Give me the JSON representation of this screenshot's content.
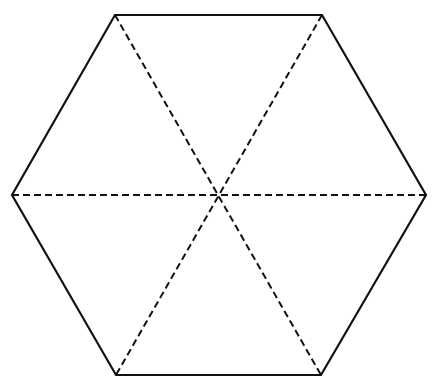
{
  "diagram": {
    "shape": "regular-hexagon",
    "background": "#ffffff",
    "stroke_color": "#111111",
    "outline_stroke_width": 2.2,
    "diagonal_stroke_width": 2,
    "diagonal_dash": "7 4",
    "center": {
      "x": 218,
      "y": 195
    },
    "vertices": [
      {
        "name": "top-left",
        "x": 115,
        "y": 15
      },
      {
        "name": "top-right",
        "x": 322,
        "y": 15
      },
      {
        "name": "right",
        "x": 426,
        "y": 195
      },
      {
        "name": "bottom-right",
        "x": 321,
        "y": 375
      },
      {
        "name": "bottom-left",
        "x": 116,
        "y": 375
      },
      {
        "name": "left",
        "x": 12,
        "y": 195
      }
    ],
    "diagonals": [
      {
        "name": "diagonal-top-left-to-bottom-right",
        "from": 0,
        "to": 3,
        "style": "dashed"
      },
      {
        "name": "diagonal-top-right-to-bottom-left",
        "from": 1,
        "to": 4,
        "style": "dashed"
      },
      {
        "name": "diagonal-left-to-right",
        "from": 5,
        "to": 2,
        "style": "dashed"
      }
    ]
  }
}
